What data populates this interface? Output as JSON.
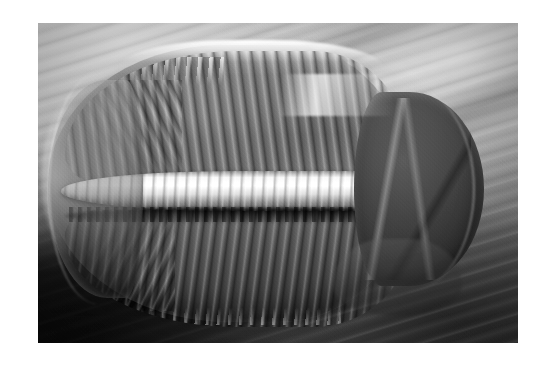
{
  "page": {
    "background_color": "#ffffff",
    "width": 551,
    "height": 366
  },
  "photograph": {
    "subject": "trilobite-fossil",
    "caption": "",
    "orientation": "dorsal view, head to the right",
    "color_mode": "grayscale",
    "frame": {
      "left": 38,
      "top": 23,
      "width": 480,
      "height": 320
    },
    "palette": {
      "highlight_white": "#ffffff",
      "matrix_light_gray": "#cfcfcf",
      "shell_mid_gray": "#8a8a8a",
      "shell_dark_gray": "#5a5a5a",
      "cephalon_dark": "#3a3a3a",
      "shadow_black": "#121212"
    },
    "regions": [
      {
        "name": "rock-matrix-upper-left",
        "description": "light gray limestone matrix with diagonal striations"
      },
      {
        "name": "rock-matrix-upper-right",
        "description": "light gray matrix with fine parallel scratch lines"
      },
      {
        "name": "shadow-lower-left",
        "description": "deep black shadow at lower left of the slab"
      },
      {
        "name": "trilobite-body",
        "description": "oval exoskeleton spanning most of the frame"
      },
      {
        "name": "axial-lobe",
        "description": "bright segmented central ridge running left to right"
      },
      {
        "name": "pleural-ribs-upper",
        "description": "closely spaced ribs radiating upward from the axis"
      },
      {
        "name": "pleural-ribs-lower",
        "description": "closely spaced ribs radiating downward from the axis"
      },
      {
        "name": "pygidium",
        "description": "rounded tail shield at the left end"
      },
      {
        "name": "cephalon",
        "description": "darker head shield at the right end"
      }
    ]
  }
}
